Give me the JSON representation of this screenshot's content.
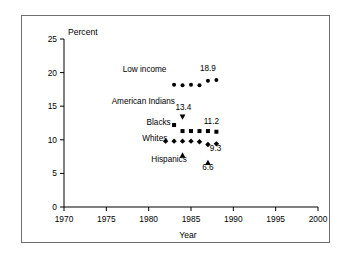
{
  "chart_data": {
    "type": "scatter",
    "title": "",
    "xlabel": "Year",
    "ylabel": "Percent",
    "xlim": [
      1970,
      2000
    ],
    "ylim": [
      0,
      25
    ],
    "xticks": [
      1970,
      1975,
      1980,
      1985,
      1990,
      1995,
      2000
    ],
    "yticks": [
      0,
      5,
      10,
      15,
      20,
      25
    ],
    "xtick_labels": [
      "1970",
      "1975",
      "1980",
      "1985",
      "1990",
      "1995",
      "2000"
    ],
    "ytick_labels": [
      "0",
      "5",
      "10",
      "15",
      "20",
      "25"
    ],
    "grid": false,
    "legend_position": "inline-labels",
    "series": [
      {
        "name": "Low income",
        "marker": "circle",
        "color": "#000000",
        "x": [
          1983,
          1984,
          1985,
          1986,
          1987,
          1988
        ],
        "y": [
          18.2,
          18.1,
          18.2,
          18.1,
          18.8,
          18.9
        ],
        "label": "Low income",
        "value_label": "18.9"
      },
      {
        "name": "American Indians",
        "marker": "triangle-down",
        "color": "#000000",
        "x": [
          1984
        ],
        "y": [
          13.4
        ],
        "label": "American Indians",
        "value_label": "13.4"
      },
      {
        "name": "Blacks",
        "marker": "square",
        "color": "#000000",
        "x": [
          1983,
          1984,
          1985,
          1986,
          1987,
          1988
        ],
        "y": [
          12.2,
          11.3,
          11.3,
          11.3,
          11.3,
          11.2
        ],
        "label": "Blacks",
        "value_label": "11.2"
      },
      {
        "name": "Whites",
        "marker": "diamond",
        "color": "#000000",
        "x": [
          1982,
          1983,
          1984,
          1985,
          1986,
          1987,
          1988
        ],
        "y": [
          9.8,
          9.8,
          9.8,
          9.8,
          9.7,
          9.3,
          9.4
        ],
        "label": "Whites",
        "value_label": "9.3"
      },
      {
        "name": "Hispanics",
        "marker": "triangle-up",
        "color": "#000000",
        "x": [
          1984,
          1987
        ],
        "y": [
          7.7,
          6.6
        ],
        "label": "Hispanics",
        "value_label": "6.6"
      }
    ],
    "annotations": [
      {
        "text": "Low income",
        "x": 1982.1,
        "y": 20.1,
        "anchor": "end"
      },
      {
        "text": "18.9",
        "x": 1987.0,
        "y": 20.2,
        "anchor": "middle"
      },
      {
        "text": "American Indians",
        "x": 1983.1,
        "y": 15.3,
        "anchor": "end"
      },
      {
        "text": "13.4",
        "x": 1984.1,
        "y": 14.5,
        "anchor": "middle"
      },
      {
        "text": "Blacks",
        "x": 1982.6,
        "y": 12.2,
        "anchor": "end"
      },
      {
        "text": "11.2",
        "x": 1987.4,
        "y": 12.3,
        "anchor": "middle"
      },
      {
        "text": "Whites",
        "x": 1982.2,
        "y": 9.8,
        "anchor": "end"
      },
      {
        "text": "9.3",
        "x": 1987.9,
        "y": 8.3,
        "anchor": "middle"
      },
      {
        "text": "Hispanics",
        "x": 1984.5,
        "y": 6.7,
        "anchor": "end"
      },
      {
        "text": "6.6",
        "x": 1987.0,
        "y": 5.5,
        "anchor": "middle"
      }
    ]
  }
}
